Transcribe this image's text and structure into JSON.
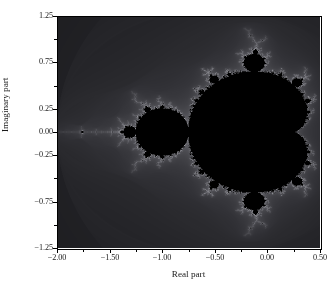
{
  "chart_data": {
    "type": "heatmap",
    "title": "",
    "subtitle": "",
    "xlabel": "Real part",
    "ylabel": "Imaginary part",
    "xlim": [
      -2.0,
      0.5
    ],
    "ylim": [
      -1.25,
      1.25
    ],
    "grid": false,
    "legend": "none",
    "colormap": "dark-grayscale",
    "xticks": [
      -2.0,
      -1.5,
      -1.0,
      -0.5,
      0.0,
      0.5
    ],
    "xticklabels": [
      "−2.00",
      "−1.50",
      "−1.00",
      "−0.50",
      "0.00",
      "0.50"
    ],
    "xminorticks": [
      -1.75,
      -1.25,
      -0.75,
      -0.25,
      0.25
    ],
    "yticks": [
      1.25,
      0.75,
      0.25,
      0.0,
      -0.25,
      -0.75,
      -1.25
    ],
    "yticklabels": [
      "1.25",
      "0.75",
      "0.25",
      "0.00",
      "−0.25",
      "−0.75",
      "−1.25"
    ],
    "yminorticks": [
      1.0,
      0.5,
      -0.5,
      -1.0
    ],
    "max_iterations": 60,
    "escape_radius": 2.0,
    "band_colors": [
      "#000000",
      "#0a0a0c",
      "#121214",
      "#17171a",
      "#1d1d20",
      "#232327",
      "#2a2a2e",
      "#313136",
      "#38383d",
      "#404045",
      "#48484d",
      "#505056",
      "#5a5a60",
      "#64646a",
      "#6e6e74",
      "#78787e",
      "#828288",
      "#8c8c92",
      "#96969c",
      "#a0a0a6"
    ],
    "set_color": "#000000",
    "background_color": "#ffffff",
    "axis_color": "#000000"
  }
}
